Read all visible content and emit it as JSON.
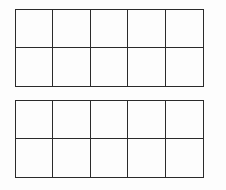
{
  "diagram": {
    "type": "ten-frames",
    "line_color": "#2a2a2a",
    "background": "#fdfdfd",
    "frames": [
      {
        "name": "top-ten-frame",
        "rows": 2,
        "cols": 5,
        "x": 15,
        "y": 9,
        "width": 189,
        "height": 78,
        "filled_cells": []
      },
      {
        "name": "bottom-ten-frame",
        "rows": 2,
        "cols": 5,
        "x": 15,
        "y": 100,
        "width": 189,
        "height": 78,
        "filled_cells": []
      }
    ]
  }
}
